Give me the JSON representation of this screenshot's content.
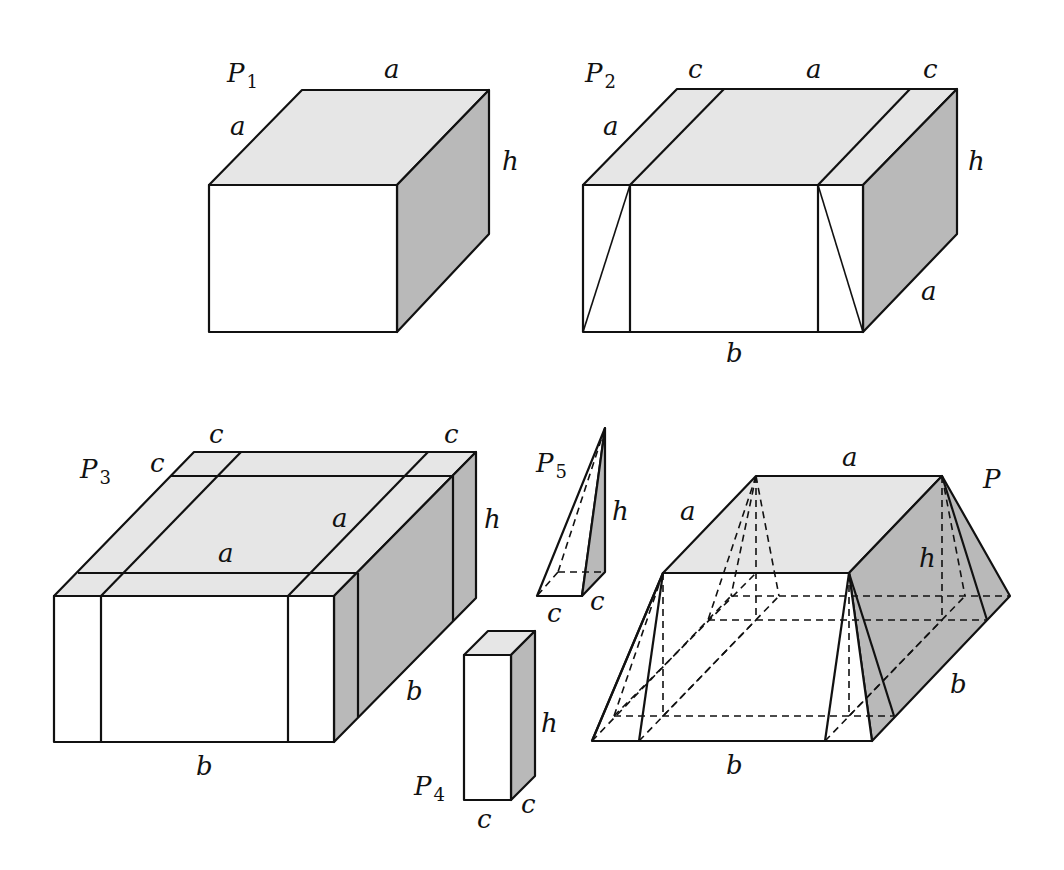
{
  "figures": {
    "p1": {
      "name": "P",
      "subscript": "1",
      "labels": {
        "top_back": "a",
        "top_left": "a",
        "right_height": "h"
      }
    },
    "p2": {
      "name": "P",
      "subscript": "2",
      "labels": {
        "top_c_left": "c",
        "top_a": "a",
        "top_c_right": "c",
        "top_left": "a",
        "right_height": "h",
        "right_depth": "a",
        "bottom": "b"
      }
    },
    "p3": {
      "name": "P",
      "subscript": "3",
      "labels": {
        "top_c_left": "c",
        "left_c": "c",
        "top_c_right": "c",
        "top_a_right": "a",
        "top_a_middle": "a",
        "right_height": "h",
        "right_depth": "b",
        "bottom": "b"
      }
    },
    "p4": {
      "name": "P",
      "subscript": "4",
      "labels": {
        "height": "h",
        "bottom": "c",
        "depth": "c"
      }
    },
    "p5": {
      "name": "P",
      "subscript": "5",
      "labels": {
        "height": "h",
        "bottom": "c",
        "depth": "c"
      }
    },
    "p": {
      "name": "P",
      "labels": {
        "top_back": "a",
        "top_left": "a",
        "height": "h",
        "right_depth": "b",
        "bottom": "b"
      }
    }
  },
  "colors": {
    "top_face": "#e6e6e6",
    "side_face": "#b9b9b9",
    "front_face": "#ffffff",
    "line": "#111111"
  }
}
